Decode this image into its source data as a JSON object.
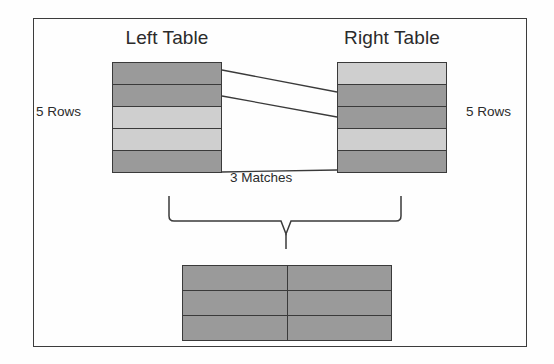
{
  "diagram": {
    "title_left": "Left Table",
    "title_right": "Right Table",
    "label_rows_left": "5 Rows",
    "label_rows_right": "5 Rows",
    "label_matches": "3 Matches",
    "colors": {
      "shade_dark": "#9a9a9a",
      "shade_light": "#cfcfcf",
      "line": "#3a3a3a",
      "frame": "#3c3c3c",
      "text": "#2b2b2b",
      "background": "#fefefe"
    },
    "left_table": {
      "rows": 5,
      "row_shades": [
        "dark",
        "dark",
        "light",
        "light",
        "dark"
      ]
    },
    "right_table": {
      "rows": 5,
      "row_shades": [
        "light",
        "dark",
        "dark",
        "light",
        "dark"
      ]
    },
    "result_table": {
      "rows": 3,
      "columns": 2,
      "row_shades": [
        "dark",
        "dark",
        "dark"
      ]
    },
    "match_lines": 3,
    "brace": {
      "label": "join-brace",
      "direction": "down"
    }
  }
}
